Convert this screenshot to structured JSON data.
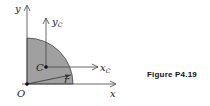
{
  "figure": {
    "caption": "Figure P4.19",
    "labels": {
      "y_axis": "y",
      "x_axis": "x",
      "origin": "O",
      "centroid": "C",
      "yc_main": "y",
      "yc_sub": "C",
      "xc_main": "x",
      "xc_sub": "C",
      "radius": "r"
    },
    "colors": {
      "fill": "#9a9a9a",
      "stroke": "#333333"
    }
  }
}
